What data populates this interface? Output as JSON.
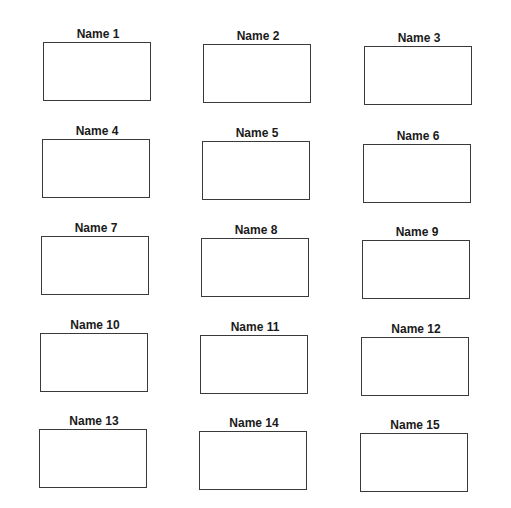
{
  "sheet": {
    "cells": [
      {
        "label": "Name 1"
      },
      {
        "label": "Name 2"
      },
      {
        "label": "Name 3"
      },
      {
        "label": "Name 4"
      },
      {
        "label": "Name 5"
      },
      {
        "label": "Name 6"
      },
      {
        "label": "Name 7"
      },
      {
        "label": "Name 8"
      },
      {
        "label": "Name 9"
      },
      {
        "label": "Name 10"
      },
      {
        "label": "Name 11"
      },
      {
        "label": "Name 12"
      },
      {
        "label": "Name 13"
      },
      {
        "label": "Name 14"
      },
      {
        "label": "Name 15"
      }
    ]
  }
}
